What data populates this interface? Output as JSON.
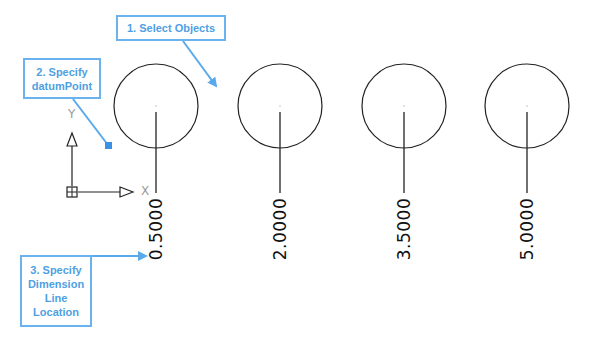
{
  "callouts": {
    "step1": "1. Select Objects",
    "step2_line1": "2. Specify",
    "step2_line2": "datumPoint",
    "step3_line1": "3. Specify",
    "step3_line2": "Dimension",
    "step3_line3": "Line",
    "step3_line4": "Location"
  },
  "ucs": {
    "x_label": "X",
    "y_label": "Y"
  },
  "dimensions": [
    {
      "value": "0.5000"
    },
    {
      "value": "2.0000"
    },
    {
      "value": "3.5000"
    },
    {
      "value": "5.0000"
    }
  ],
  "colors": {
    "callout": "#6bb3ee",
    "callout_text": "#4f9fe3",
    "marker": "#3c8fe6",
    "geometry": "#222222"
  }
}
